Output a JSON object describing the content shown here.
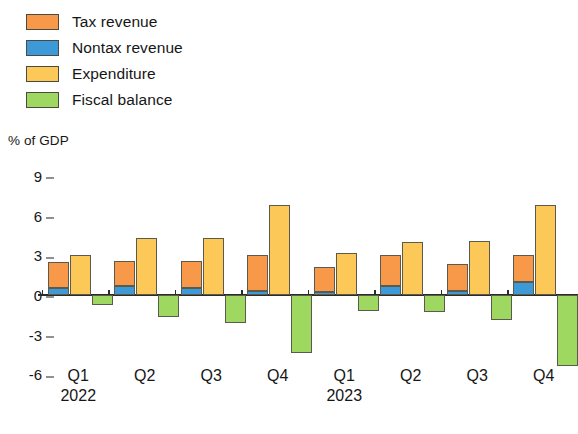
{
  "legend": {
    "items": [
      {
        "label": "Tax revenue",
        "key": "tax",
        "color": "#f79948"
      },
      {
        "label": "Nontax revenue",
        "key": "nontax",
        "color": "#3e9ad6"
      },
      {
        "label": "Expenditure",
        "key": "exp",
        "color": "#fcc959"
      },
      {
        "label": "Fiscal balance",
        "key": "balance",
        "color": "#9ed860"
      }
    ]
  },
  "axis": {
    "y_title": "% of GDP",
    "y_ticks": [
      "9",
      "6",
      "3",
      "0",
      "-3",
      "-6"
    ]
  },
  "year_labels": [
    {
      "text": "2022",
      "at_category": 0
    },
    {
      "text": "2023",
      "at_category": 4
    }
  ],
  "chart_data": {
    "type": "bar",
    "title": "",
    "subtitle": "",
    "xlabel": "",
    "ylabel": "% of GDP",
    "ylim": [
      -7.2,
      9.6
    ],
    "yticks": [
      9,
      6,
      3,
      0,
      -3,
      -6
    ],
    "grid": false,
    "legend_position": "top-left",
    "categories": [
      "Q1",
      "Q2",
      "Q3",
      "Q4",
      "Q1",
      "Q2",
      "Q3",
      "Q4"
    ],
    "category_years": [
      "2022",
      "2022",
      "2022",
      "2022",
      "2023",
      "2023",
      "2023",
      "2023"
    ],
    "stacking": "Tax revenue stacked above Nontax revenue in a single revenue bar; Expenditure is a separate bar; Fiscal balance is a separate bar plotted below zero",
    "series": [
      {
        "name": "Nontax revenue",
        "color": "#3e9ad6",
        "values": [
          0.5,
          0.7,
          0.5,
          0.3,
          0.2,
          0.7,
          0.3,
          1.0
        ]
      },
      {
        "name": "Tax revenue",
        "color": "#f79948",
        "values": [
          2.0,
          1.9,
          2.1,
          2.7,
          1.9,
          2.3,
          2.0,
          2.0
        ]
      },
      {
        "name": "Expenditure",
        "color": "#fcc959",
        "values": [
          3.0,
          4.3,
          4.3,
          6.8,
          3.2,
          4.0,
          4.1,
          6.8
        ]
      },
      {
        "name": "Fiscal balance",
        "color": "#9ed860",
        "values": [
          -0.8,
          -1.7,
          -2.1,
          -4.4,
          -1.2,
          -1.3,
          -1.9,
          -5.4
        ]
      }
    ],
    "revenue_totals": [
      2.5,
      2.6,
      2.6,
      3.0,
      2.1,
      3.0,
      2.3,
      3.0
    ]
  }
}
